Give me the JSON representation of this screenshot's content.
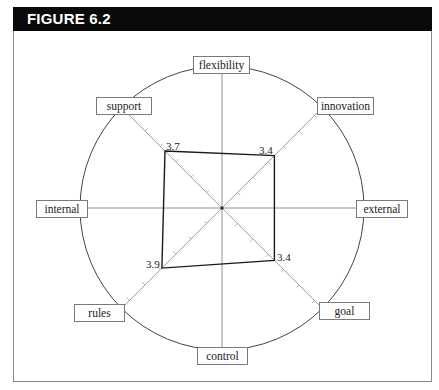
{
  "figure": {
    "title": "FIGURE 6.2"
  },
  "chart_data": {
    "type": "radar",
    "title": "FIGURE 6.2",
    "axes": [
      "flexibility",
      "innovation",
      "external",
      "goal",
      "control",
      "rules",
      "internal",
      "support"
    ],
    "plotted_axes": [
      "support",
      "innovation",
      "goal",
      "rules"
    ],
    "values": {
      "support": 3.7,
      "innovation": 3.4,
      "goal": 3.4,
      "rules": 3.9
    },
    "value_labels": [
      "3.7",
      "3.4",
      "3.4",
      "3.9"
    ],
    "grid": "diagonal axes with unit tick marks; horizontal and vertical axes without ticks",
    "outer_circle": true
  },
  "labels": {
    "flexibility": "flexibility",
    "innovation": "innovation",
    "external": "external",
    "goal": "goal",
    "control": "control",
    "rules": "rules",
    "internal": "internal",
    "support": "support"
  },
  "value_text": {
    "support": "3.7",
    "innovation": "3.4",
    "goal": "3.4",
    "rules": "3.9"
  }
}
